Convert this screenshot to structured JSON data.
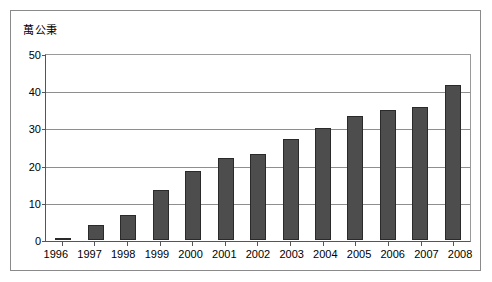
{
  "chart_data": {
    "type": "bar",
    "title": "萬公秉",
    "xlabel": "",
    "ylabel": "萬公秉",
    "categories": [
      "1996",
      "1997",
      "1998",
      "1999",
      "2000",
      "2001",
      "2002",
      "2003",
      "2004",
      "2005",
      "2006",
      "2007",
      "2008"
    ],
    "values": [
      0.3,
      4.0,
      6.8,
      13.5,
      18.5,
      22.0,
      23.0,
      27.2,
      30.2,
      33.4,
      34.9,
      35.7,
      41.6
    ],
    "ylim": [
      0,
      50
    ],
    "ytick_labels": [
      "50",
      "40",
      "30",
      "20",
      "10",
      "0"
    ],
    "ytick_values": [
      50,
      40,
      30,
      20,
      10,
      0
    ],
    "grid": true,
    "legend": false,
    "legend_position": "none",
    "bar_color": "#4d4d4d",
    "bar_border_color": "#2a2a2a",
    "gridline_color": "#8e8e8e",
    "axis_color": "#555555",
    "frame_color": "#8a8a8a",
    "background_color": "#ffffff"
  }
}
